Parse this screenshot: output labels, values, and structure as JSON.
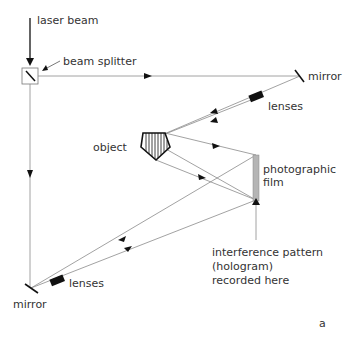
{
  "diagram": {
    "labels": {
      "laser_beam": "laser beam",
      "beam_splitter": "beam splitter",
      "mirror_top": "mirror",
      "lenses_top": "lenses",
      "object": "object",
      "film_line1": "photographic",
      "film_line2": "film",
      "interference_line1": "interference pattern",
      "interference_line2": "(hologram)",
      "interference_line3": "recorded here",
      "lenses_bottom": "lenses",
      "mirror_bottom": "mirror",
      "panel_letter": "a"
    },
    "colors": {
      "beam": "#8a8a8a",
      "ink": "#111111",
      "film": "#b5b5b5"
    }
  }
}
